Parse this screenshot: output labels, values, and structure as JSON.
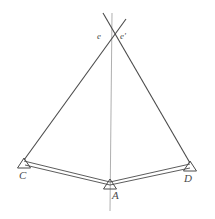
{
  "figure": {
    "type": "structural-geometry-diagram",
    "width": 215,
    "height": 219,
    "background_color": "#ffffff",
    "stroke_color": "#4a4a4a",
    "axis_color": "#9a9a9a"
  },
  "labels": {
    "apex_left": "e",
    "apex_right": "e'",
    "support_left": "C",
    "support_center": "A",
    "support_right": "D"
  },
  "points": {
    "apex": {
      "x": 113,
      "y": 38
    },
    "support_left": {
      "x": 24,
      "y": 163
    },
    "support_center": {
      "x": 110,
      "y": 184
    },
    "support_right": {
      "x": 190,
      "y": 166
    }
  },
  "geometry": {
    "axis_line": {
      "x1": 112,
      "y1": 13,
      "x2": 110,
      "y2": 211
    },
    "diagonal_left_to_apex": {
      "x1": 24,
      "y1": 160,
      "x2": 125,
      "y2": 20
    },
    "diagonal_right_to_apex": {
      "x1": 190,
      "y1": 163,
      "x2": 104,
      "y2": 14
    },
    "beam_left": {
      "x1": 24,
      "y1": 163,
      "x2": 110,
      "y2": 184
    },
    "beam_right": {
      "x1": 110,
      "y1": 184,
      "x2": 190,
      "y2": 166
    },
    "beam_offset_px": 3,
    "support_triangle_width": 13,
    "support_triangle_height": 10
  }
}
